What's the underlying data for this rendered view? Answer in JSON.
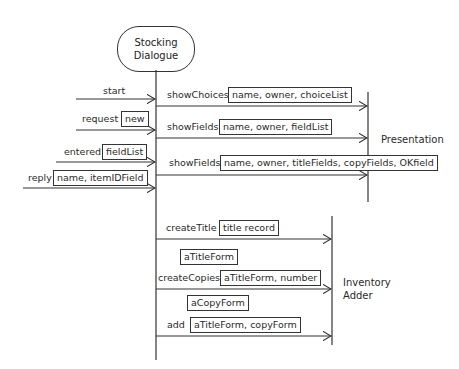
{
  "object": {
    "line1": "Stocking",
    "line2": "Dialogue"
  },
  "participants": {
    "presentation": "Presentation",
    "inventory_line1": "Inventory",
    "inventory_line2": "Adder"
  },
  "incoming": [
    {
      "label": "start",
      "args": ""
    },
    {
      "label": "request",
      "args": "new"
    },
    {
      "label": "entered",
      "args": "fieldList"
    },
    {
      "label": "reply",
      "args": "name, itemIDField"
    }
  ],
  "to_presentation": [
    {
      "label": "showChoices",
      "args": "name, owner, choiceList"
    },
    {
      "label": "showFields",
      "args": "name, owner, fieldList"
    },
    {
      "label": "showFields",
      "args": "name, owner, titleFields, copyFields, OKfield"
    }
  ],
  "to_inventory": [
    {
      "label": "createTitle",
      "args": "title record"
    },
    {
      "label": "",
      "args": "aTitleForm",
      "kind": "return"
    },
    {
      "label": "createCopies",
      "args": "aTitleForm, number"
    },
    {
      "label": "",
      "args": "aCopyForm",
      "kind": "return"
    },
    {
      "label": "add",
      "args": "aTitleForm, copyForm"
    }
  ],
  "colors": {
    "line": "#333333",
    "background": "#ffffff"
  }
}
